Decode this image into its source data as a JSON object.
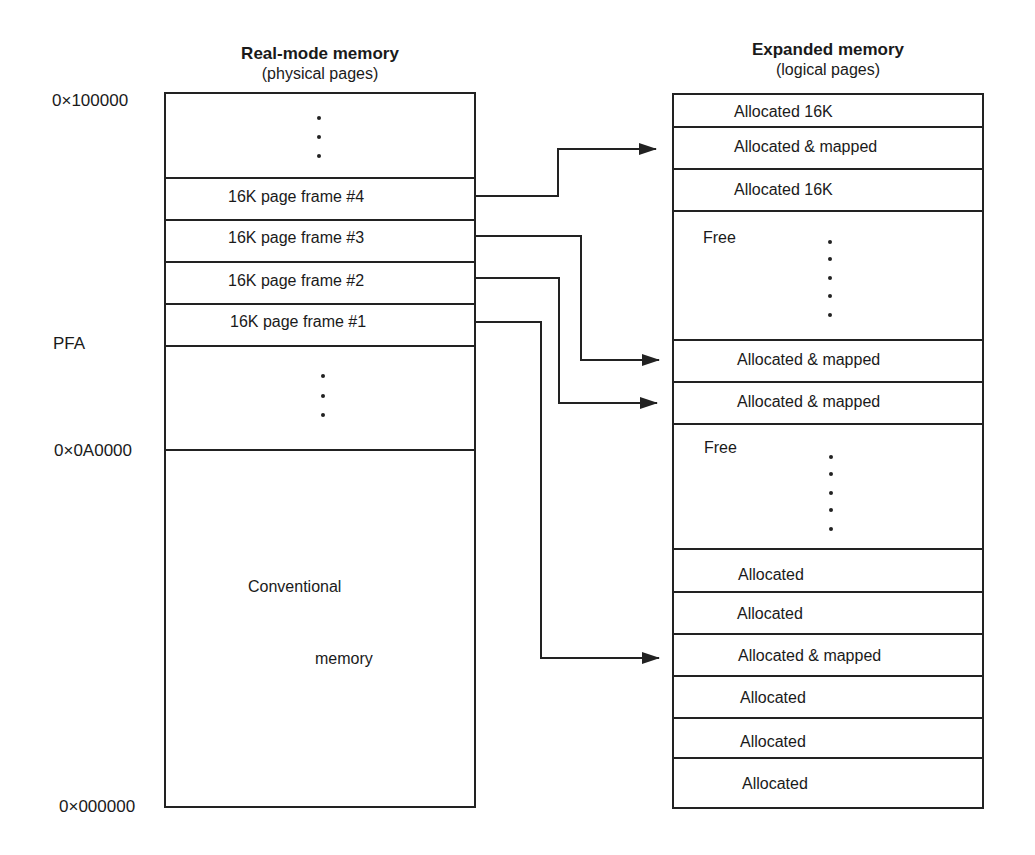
{
  "left_column": {
    "title": "Real-mode memory",
    "subtitle": "(physical pages)",
    "address_labels": {
      "top": "0×100000",
      "pfa": "PFA",
      "mid": "0×0A0000",
      "bottom": "0×000000"
    },
    "rows": [
      {
        "label": "",
        "type": "ellipsis"
      },
      {
        "label": "16K page frame #4"
      },
      {
        "label": "16K page frame #3"
      },
      {
        "label": "16K page frame #2"
      },
      {
        "label": "16K page frame #1"
      },
      {
        "label": "",
        "type": "ellipsis"
      },
      {
        "label_line1": "Conventional",
        "label_line2": "memory"
      }
    ]
  },
  "right_column": {
    "title": "Expanded memory",
    "subtitle": "(logical pages)",
    "rows": [
      {
        "label": "Allocated 16K"
      },
      {
        "label": "Allocated & mapped"
      },
      {
        "label": "Allocated 16K"
      },
      {
        "label": "Free",
        "type": "ellipsis"
      },
      {
        "label": "Allocated & mapped"
      },
      {
        "label": "Allocated & mapped"
      },
      {
        "label": "Free",
        "type": "ellipsis"
      },
      {
        "label": "Allocated"
      },
      {
        "label": "Allocated"
      },
      {
        "label": "Allocated & mapped"
      },
      {
        "label": "Allocated"
      },
      {
        "label": "Allocated"
      },
      {
        "label": "Allocated"
      }
    ]
  },
  "mappings": [
    {
      "from": "16K page frame #4",
      "to": "Allocated & mapped (row 2)"
    },
    {
      "from": "16K page frame #3",
      "to": "Allocated & mapped (row 5)"
    },
    {
      "from": "16K page frame #2",
      "to": "Allocated & mapped (row 6)"
    },
    {
      "from": "16K page frame #1",
      "to": "Allocated & mapped (row 10)"
    }
  ],
  "colors": {
    "line": "#222222",
    "text": "#1a1a1a",
    "background": "#ffffff"
  }
}
